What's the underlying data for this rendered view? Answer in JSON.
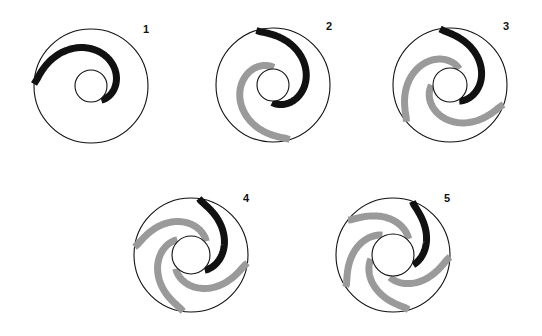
{
  "page": {
    "background_color": "#ffffff",
    "width": 542,
    "height": 336
  },
  "style": {
    "outline_color": "#111111",
    "arm_black": "#111111",
    "arm_gray": "#9a9a9a",
    "outline_width": 1.1,
    "arm_width_black": 7,
    "arm_width_gray": 7,
    "label_color": "#111111"
  },
  "figures": [
    {
      "label": "1",
      "label_x": 146,
      "label_y": 33,
      "cx": 91,
      "cy": 86,
      "outer_r": 57,
      "inner_r": 16,
      "arm_count": 1,
      "arm_start_angle": -178,
      "arm_sweep": 232,
      "arm_colors": [
        "black"
      ],
      "spiral_turns": 0.64
    },
    {
      "label": "2",
      "label_x": 329,
      "label_y": 30,
      "cx": 273,
      "cy": 85,
      "outer_r": 57,
      "inner_r": 16,
      "arm_count": 2,
      "arm_start_angle": -107,
      "arm_sweep": 200,
      "arm_colors": [
        "black",
        "gray"
      ],
      "spiral_turns": 0.55
    },
    {
      "label": "3",
      "label_x": 506,
      "label_y": 30,
      "cx": 450,
      "cy": 85,
      "outer_r": 57,
      "inner_r": 17,
      "arm_count": 3,
      "arm_start_angle": -100,
      "arm_sweep": 160,
      "arm_colors": [
        "black",
        "gray",
        "gray"
      ],
      "spiral_turns": 0.44
    },
    {
      "label": "4",
      "label_x": 246,
      "label_y": 202,
      "cx": 191,
      "cy": 255,
      "outer_r": 57,
      "inner_r": 19,
      "arm_count": 4,
      "arm_start_angle": -82,
      "arm_sweep": 130,
      "arm_colors": [
        "black",
        "gray",
        "gray",
        "gray"
      ],
      "spiral_turns": 0.36
    },
    {
      "label": "5",
      "label_x": 447,
      "label_y": 202,
      "cx": 393,
      "cy": 255,
      "outer_r": 57,
      "inner_r": 21,
      "arm_count": 5,
      "arm_start_angle": -70,
      "arm_sweep": 96,
      "arm_colors": [
        "black",
        "gray",
        "gray",
        "gray",
        "gray"
      ],
      "spiral_turns": 0.26
    }
  ]
}
